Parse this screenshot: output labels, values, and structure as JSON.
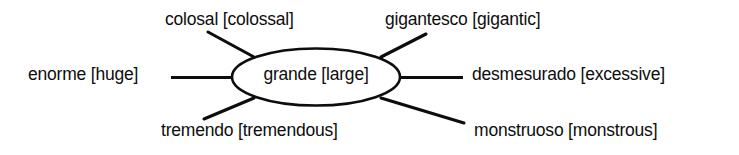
{
  "diagram": {
    "type": "semantic-word-web",
    "style": {
      "ink_color": "#0d0d0d",
      "background_color": "#ffffff"
    },
    "center": {
      "term": "grande",
      "gloss": "large",
      "label": "grande [large]",
      "shape": "ellipse"
    },
    "branches": [
      {
        "id": "colosal",
        "term": "colosal",
        "gloss": "colossal",
        "label": "colosal [colossal]",
        "position": "top-left",
        "connector": "diagonal"
      },
      {
        "id": "gigantesco",
        "term": "gigantesco",
        "gloss": "gigantic",
        "label": "gigantesco [gigantic]",
        "position": "top-right",
        "connector": "diagonal"
      },
      {
        "id": "enorme",
        "term": "enorme",
        "gloss": "huge",
        "label": "enorme [huge]",
        "position": "left",
        "connector": "horizontal"
      },
      {
        "id": "desmesurado",
        "term": "desmesurado",
        "gloss": "excessive",
        "label": "desmesurado [excessive]",
        "position": "right",
        "connector": "horizontal"
      },
      {
        "id": "tremendo",
        "term": "tremendo",
        "gloss": "tremendous",
        "label": "tremendo [tremendous]",
        "position": "bottom-left",
        "connector": "diagonal"
      },
      {
        "id": "monstruoso",
        "term": "monstruoso",
        "gloss": "monstrous",
        "label": "monstruoso [monstrous]",
        "position": "bottom-right",
        "connector": "diagonal"
      }
    ]
  }
}
